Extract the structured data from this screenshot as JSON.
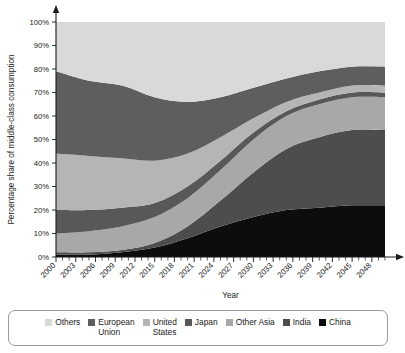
{
  "chart_data": {
    "type": "area",
    "stacked": true,
    "title": "",
    "xlabel": "Year",
    "ylabel": "Percentage share of middle-class consumption",
    "xlim": [
      2000,
      2050
    ],
    "ylim": [
      0,
      100
    ],
    "grid": false,
    "legend_position": "bottom",
    "x_tick_labels": [
      "2000",
      "2003",
      "2006",
      "2009",
      "2012",
      "2015",
      "2018",
      "2021",
      "2024",
      "2027",
      "2030",
      "2033",
      "2036",
      "2039",
      "2042",
      "2045",
      "2048"
    ],
    "x_tick_values": [
      2000,
      2003,
      2006,
      2009,
      2012,
      2015,
      2018,
      2021,
      2024,
      2027,
      2030,
      2033,
      2036,
      2039,
      2042,
      2045,
      2048
    ],
    "x_minor_tick_step": 1,
    "y_tick_labels": [
      "0%",
      "10%",
      "20%",
      "30%",
      "40%",
      "50%",
      "60%",
      "70%",
      "80%",
      "90%",
      "100%"
    ],
    "y_tick_values": [
      0,
      10,
      20,
      30,
      40,
      50,
      60,
      70,
      80,
      90,
      100
    ],
    "x": [
      2000,
      2005,
      2010,
      2015,
      2020,
      2025,
      2030,
      2035,
      2040,
      2045,
      2050
    ],
    "stack_order_bottom_to_top": [
      "China",
      "India",
      "Other Asia",
      "Japan",
      "United States",
      "European Union",
      "Others"
    ],
    "series": [
      {
        "name": "China",
        "color": "#0d0d0d",
        "values": [
          1,
          1,
          2,
          4,
          8,
          13,
          17,
          20,
          21,
          22,
          22
        ]
      },
      {
        "name": "India",
        "color": "#4d4d4d",
        "values": [
          1,
          1,
          1,
          2,
          5,
          11,
          19,
          26,
          30,
          32,
          32
        ]
      },
      {
        "name": "Other Asia",
        "color": "#a8a8a8",
        "values": [
          8,
          9,
          10,
          11,
          12,
          13,
          14,
          14,
          14,
          14,
          14
        ]
      },
      {
        "name": "Japan",
        "color": "#585858",
        "values": [
          10,
          9,
          8,
          6,
          5,
          4,
          3,
          2,
          2,
          2,
          2
        ]
      },
      {
        "name": "United States",
        "color": "#b5b5b5",
        "values": [
          24,
          23,
          21,
          18,
          14,
          10,
          6,
          4,
          3,
          3,
          3
        ]
      },
      {
        "name": "European Union",
        "color": "#5e5e5e",
        "values": [
          35,
          32,
          31,
          27,
          22,
          17,
          13,
          10,
          9,
          8,
          8
        ]
      },
      {
        "name": "Others",
        "color": "#d9d9d9",
        "values": [
          21,
          25,
          27,
          32,
          34,
          32,
          28,
          24,
          21,
          19,
          19
        ]
      }
    ],
    "cumulative_tops": {
      "China": [
        1,
        1,
        2,
        4,
        8,
        13,
        17,
        20,
        21,
        22,
        22
      ],
      "India": [
        2,
        2,
        3,
        6,
        13,
        24,
        36,
        46,
        51,
        54,
        54
      ],
      "Other Asia": [
        10,
        11,
        13,
        17,
        25,
        37,
        50,
        60,
        65,
        68,
        68
      ],
      "Japan": [
        20,
        20,
        21,
        23,
        30,
        41,
        53,
        62,
        67,
        70,
        70
      ],
      "United States": [
        44,
        43,
        42,
        41,
        44,
        51,
        59,
        66,
        70,
        73,
        73
      ],
      "European Union": [
        79,
        75,
        73,
        68,
        66,
        68,
        72,
        76,
        79,
        81,
        81
      ],
      "Others": [
        100,
        100,
        100,
        100,
        100,
        100,
        100,
        100,
        100,
        100,
        100
      ]
    },
    "legend": [
      {
        "label": "Others",
        "color": "#d9d9d9"
      },
      {
        "label": "European\nUnion",
        "color": "#5e5e5e"
      },
      {
        "label": "United\nStates",
        "color": "#b5b5b5"
      },
      {
        "label": "Japan",
        "color": "#585858"
      },
      {
        "label": "Other Asia",
        "color": "#a8a8a8"
      },
      {
        "label": "India",
        "color": "#4d4d4d"
      },
      {
        "label": "China",
        "color": "#0d0d0d"
      }
    ]
  }
}
